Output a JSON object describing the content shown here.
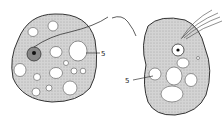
{
  "diagram": {
    "type": "biological-illustration",
    "cells": [
      {
        "name": "left-cell",
        "label": "5",
        "label_points_to": "large vacuole"
      },
      {
        "name": "right-cell",
        "label": "5",
        "label_points_to": "vacuole cluster"
      }
    ],
    "colors": {
      "stroke": "#333333",
      "fill": "#c9c9c9",
      "vacuole": "#ffffff",
      "nucleus": "#7a7a7a"
    }
  }
}
